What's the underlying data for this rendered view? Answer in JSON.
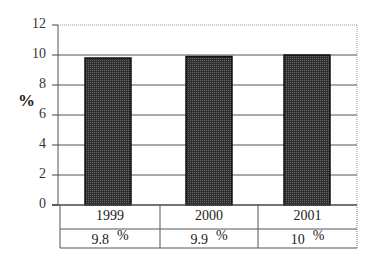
{
  "chart_data": {
    "type": "bar",
    "title": "",
    "xlabel": "",
    "ylabel": "%",
    "ylim": [
      0,
      12
    ],
    "yticks": [
      0,
      2,
      4,
      6,
      8,
      10,
      12
    ],
    "grid": true,
    "legend": null,
    "categories": [
      "1999",
      "2000",
      "2001"
    ],
    "values": [
      9.8,
      9.9,
      10
    ],
    "data_table": [
      {
        "year": "1999",
        "value": "9.8",
        "unit": "%"
      },
      {
        "year": "2000",
        "value": "9.9",
        "unit": "%"
      },
      {
        "year": "2001",
        "value": "10",
        "unit": "%"
      }
    ],
    "colors": {
      "bar_fill": "#3a3a3a",
      "bar_border": "#111111",
      "grid": "#555555",
      "frame_top": "#888888"
    }
  },
  "axis": {
    "ylabel": "%",
    "ticks": [
      "0",
      "2",
      "4",
      "6",
      "8",
      "10",
      "12"
    ]
  },
  "table": {
    "years": [
      "1999",
      "2000",
      "2001"
    ],
    "values": [
      "9.8",
      "9.9",
      "10"
    ],
    "unit": "%"
  }
}
